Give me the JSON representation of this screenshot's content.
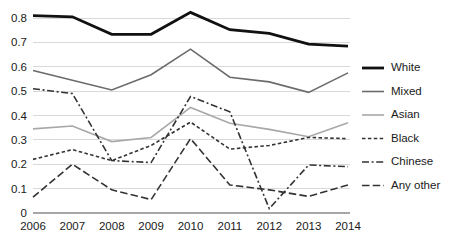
{
  "chart_data": {
    "type": "line",
    "title": "",
    "subtitle": "",
    "xlabel": "",
    "ylabel": "",
    "categories": [
      "2006",
      "2007",
      "2008",
      "2009",
      "2010",
      "2011",
      "2012",
      "2013",
      "2014"
    ],
    "xlim": [
      2006,
      2014
    ],
    "ylim": [
      0,
      0.8
    ],
    "y_ticks": [
      "0",
      "0.1",
      "0.2",
      "0.3",
      "0.4",
      "0.5",
      "0.6",
      "0.7",
      "0.8"
    ],
    "y_tick_values": [
      0,
      0.1,
      0.2,
      0.3,
      0.4,
      0.5,
      0.6,
      0.7,
      0.8
    ],
    "grid": "horizontal",
    "legend_position": "right",
    "series": [
      {
        "name": "White",
        "color": "#111111",
        "width": 2.8,
        "dash": "none",
        "dash_array": "",
        "values": [
          0.81,
          0.805,
          0.733,
          0.733,
          0.823,
          0.752,
          0.737,
          0.693,
          0.685
        ]
      },
      {
        "name": "Mixed",
        "color": "#6b6b6b",
        "width": 1.6,
        "dash": "none",
        "dash_array": "",
        "values": [
          0.585,
          0.545,
          0.505,
          0.567,
          0.672,
          0.557,
          0.538,
          0.495,
          0.575
        ]
      },
      {
        "name": "Asian",
        "color": "#a8a8a8",
        "width": 1.6,
        "dash": "none",
        "dash_array": "",
        "values": [
          0.345,
          0.357,
          0.293,
          0.31,
          0.433,
          0.368,
          0.343,
          0.313,
          0.37
        ]
      },
      {
        "name": "Black",
        "color": "#333333",
        "width": 1.6,
        "dash": "dotted",
        "dash_array": "3.5,2.4",
        "values": [
          0.22,
          0.26,
          0.215,
          0.277,
          0.373,
          0.262,
          0.277,
          0.31,
          0.305
        ]
      },
      {
        "name": "Chinese",
        "color": "#333333",
        "width": 1.6,
        "dash": "dash-dot",
        "dash_array": "7,2.6,2,2.6",
        "values": [
          0.51,
          0.49,
          0.215,
          0.207,
          0.478,
          0.415,
          0.018,
          0.197,
          0.19
        ]
      },
      {
        "name": "Any other",
        "color": "#333333",
        "width": 1.6,
        "dash": "dashed",
        "dash_array": "7.5,3.2",
        "values": [
          0.065,
          0.2,
          0.095,
          0.055,
          0.305,
          0.115,
          0.095,
          0.068,
          0.115
        ]
      }
    ]
  },
  "legend": {
    "entries": [
      {
        "label": "White"
      },
      {
        "label": "Mixed"
      },
      {
        "label": "Asian"
      },
      {
        "label": "Black"
      },
      {
        "label": "Chinese"
      },
      {
        "label": "Any other"
      }
    ]
  },
  "colors": {
    "gridline": "#d9d9d9",
    "axis": "#a6a6a6",
    "text": "#1a1a1a",
    "background": "#ffffff"
  }
}
